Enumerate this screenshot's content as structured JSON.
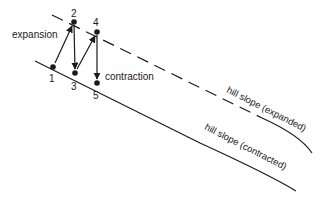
{
  "diagram": {
    "labels": {
      "expansion": "expansion",
      "contraction": "contraction",
      "slope_expanded": "hill slope (expanded)",
      "slope_contracted": "hill slope (contracted)"
    },
    "points": [
      {
        "id": "1",
        "label": "1"
      },
      {
        "id": "2",
        "label": "2"
      },
      {
        "id": "3",
        "label": "3"
      },
      {
        "id": "4",
        "label": "4"
      },
      {
        "id": "5",
        "label": "5"
      }
    ],
    "colors": {
      "ink": "#1a1a1a",
      "background": "#ffffff"
    }
  }
}
